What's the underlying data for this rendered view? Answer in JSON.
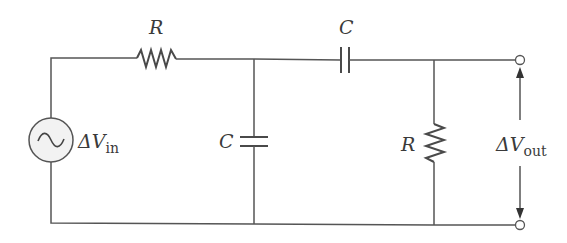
{
  "diagram": {
    "type": "circuit",
    "colors": {
      "wire": "#555555",
      "text": "#3a3a3a",
      "source_fill": "#f2f2f2",
      "background": "#ffffff"
    },
    "components": [
      {
        "id": "source",
        "kind": "ac-voltage-source",
        "label": "ΔV",
        "label_sub": "in"
      },
      {
        "id": "r1",
        "kind": "resistor",
        "label": "R",
        "position": "top-left, series"
      },
      {
        "id": "c1",
        "kind": "capacitor",
        "label": "C",
        "position": "middle, shunt to ground"
      },
      {
        "id": "c2",
        "kind": "capacitor",
        "label": "C",
        "position": "top-right, series"
      },
      {
        "id": "r2",
        "kind": "resistor",
        "label": "R",
        "position": "right, shunt to ground"
      },
      {
        "id": "output",
        "kind": "output-terminals",
        "label": "ΔV",
        "label_sub": "out"
      }
    ],
    "labels": {
      "r1": "R",
      "c1": "C",
      "c2": "C",
      "r2": "R",
      "vin_main": "ΔV",
      "vin_sub": "in",
      "vout_main": "ΔV",
      "vout_sub": "out"
    }
  }
}
